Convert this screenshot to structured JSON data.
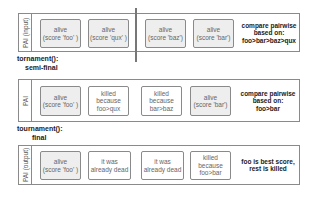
{
  "rows": [
    {
      "label": "PAI (input)",
      "cells": [
        {
          "text": "alive\n(score 'foo' )",
          "state": "alive"
        },
        {
          "text": "alive\n(score 'qux' )",
          "state": "alive"
        },
        {
          "text": "alive\n(score 'baz')",
          "state": "alive"
        },
        {
          "text": "alive\n(score 'bar')",
          "state": "alive"
        }
      ],
      "note": "compare pairwise\nbased on:\nfoo>bar>baz>qux"
    },
    {
      "label": "PAI",
      "cells": [
        {
          "text": "alive\n(score 'foo' )",
          "state": "alive"
        },
        {
          "text": "killed\nbecause\nfoo>qux",
          "state": "killed"
        },
        {
          "text": "killed\nbecause\nbar>baz",
          "state": "killed"
        },
        {
          "text": "alive\n(score 'bar')",
          "state": "alive"
        }
      ],
      "note": "compare pairwise\nbased on:\nfoo>bar"
    },
    {
      "label": "PAI (output)",
      "cells": [
        {
          "text": "alive\n(score 'foo' )",
          "state": "alive"
        },
        {
          "text": "it was\nalready dead",
          "state": "dead"
        },
        {
          "text": "it was\nalready dead",
          "state": "dead"
        },
        {
          "text": "killed\nbecause\nfoo>bar",
          "state": "killed"
        }
      ],
      "note": "foo is best score,\nrest is killed"
    }
  ],
  "captions": {
    "semi_final_fn": "tornament():",
    "semi_final_stage": "semi-final",
    "final_fn": "tournament():",
    "final_stage": "final"
  }
}
